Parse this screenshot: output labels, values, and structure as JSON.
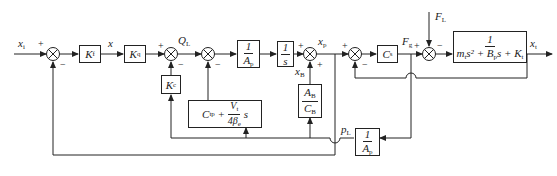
{
  "diagram": {
    "type": "block-diagram",
    "signals": {
      "input": "x_i",
      "x": "x",
      "Q": "Q_L",
      "xp": "x_p",
      "xB": "x_B",
      "F": "F_g",
      "FL": "F_L",
      "xt": "x_t",
      "pL": "p_L"
    },
    "blocks": {
      "Kf": {
        "main": "K",
        "sub": "f"
      },
      "Kq": {
        "main": "K",
        "sub": "q"
      },
      "Kc": {
        "main": "K",
        "sub": "c"
      },
      "Ap": {
        "num": "1",
        "den": "A",
        "den_sub": "p"
      },
      "integrator": {
        "num": "1",
        "den": "s"
      },
      "AbCb": {
        "num": "A",
        "num_sub": "B",
        "den": "C",
        "den_sub": "B"
      },
      "Cs": {
        "main": "C",
        "sub": "s"
      },
      "plant": {
        "num": "1",
        "den": "m_t s² + B_p s + K_t"
      },
      "leak": {
        "text": "C_tp + V_t/(4β_e) s"
      },
      "Ap2": {
        "num": "1",
        "den": "A",
        "den_sub": "p"
      }
    },
    "signs": {
      "plus": "+",
      "minus": "−"
    }
  }
}
